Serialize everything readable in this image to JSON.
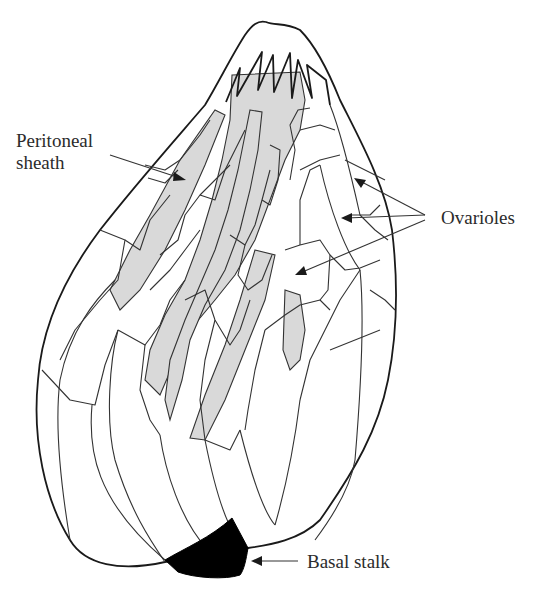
{
  "figure": {
    "colors": {
      "outline": "#1a1a1a",
      "sheath_fill": "#d9d9d9",
      "basal_stalk_fill": "#000000",
      "background": "#ffffff",
      "text": "#2b2b2b"
    }
  },
  "labels": {
    "peritoneal_sheath_line1": "Peritoneal",
    "peritoneal_sheath_line2": "sheath",
    "ovarioles": "Ovarioles",
    "basal_stalk": "Basal stalk"
  }
}
